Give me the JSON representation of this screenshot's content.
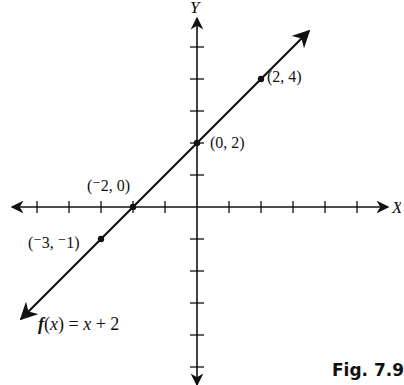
{
  "figure_label": "Fig. 7.9",
  "chart_data": {
    "type": "line",
    "title": "",
    "function": "f(x) = x + 2",
    "xlabel": "X",
    "ylabel": "Y",
    "grid": false,
    "xlim": [
      -6,
      6
    ],
    "ylim": [
      -5,
      5
    ],
    "tick_spacing": 1,
    "series": [
      {
        "name": "f(x) = x + 2",
        "x": [
          -5.5,
          3.5
        ],
        "y": [
          -3.5,
          5.5
        ]
      }
    ],
    "points": [
      {
        "x": 2,
        "y": 4,
        "label": "(2, 4)"
      },
      {
        "x": 0,
        "y": 2,
        "label": "(0, 2)"
      },
      {
        "x": -2,
        "y": 0,
        "label": "(⁻2, 0)"
      },
      {
        "x": -3,
        "y": -1,
        "label": "(⁻3, ⁻1)"
      }
    ]
  },
  "labels": {
    "x_axis": "X",
    "y_axis": "Y",
    "function": "f(x) = x + 2",
    "p1": "(2, 4)",
    "p2": "(0, 2)",
    "p3": "(⁻2, 0)",
    "p4": "(⁻3, ⁻1)"
  }
}
